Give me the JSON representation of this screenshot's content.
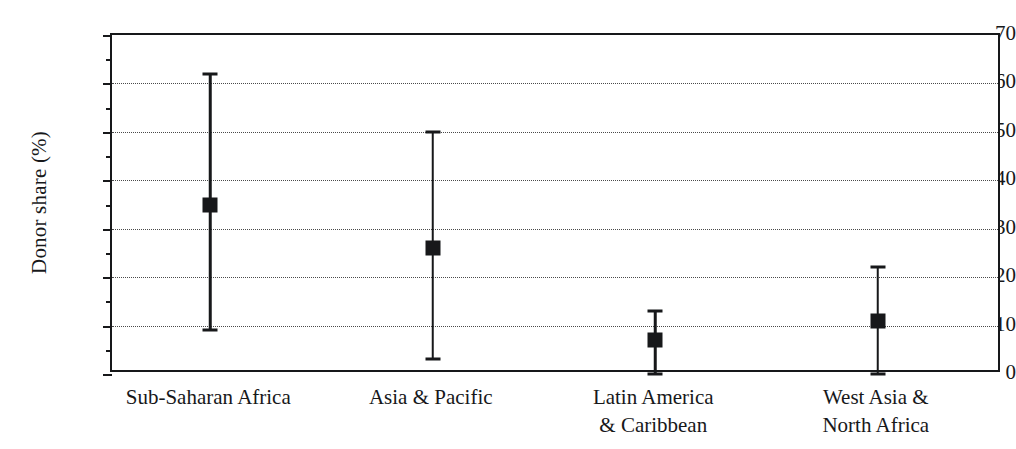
{
  "chart_data": {
    "type": "scatter",
    "title": "",
    "subtitle": "",
    "xlabel": "",
    "ylabel": "Donor share (%)",
    "ylim": [
      0,
      70
    ],
    "ytick_labels": [
      "0",
      "10",
      "20",
      "30",
      "40",
      "50",
      "60",
      "70"
    ],
    "ytick_values": [
      0,
      10,
      20,
      30,
      40,
      50,
      60,
      70
    ],
    "yminor_values": [
      5,
      15,
      25,
      35,
      45,
      55,
      65
    ],
    "grid": "horizontal-dotted-major",
    "legend": "none",
    "categories": [
      "Sub-Saharan Africa",
      "Asia & Pacific",
      "Latin America\n& Caribbean",
      "West Asia &\nNorth Africa"
    ],
    "series": [
      {
        "name": "Donor share (%)",
        "marker": "filled-square",
        "values": [
          35,
          26,
          7,
          11
        ],
        "lower": [
          9,
          3,
          0,
          0
        ],
        "upper": [
          62,
          50,
          13,
          22
        ]
      }
    ],
    "colors": {
      "marker": "#17181a",
      "line": "#17181a",
      "axis": "#17181a",
      "grid": "#4a4a4a",
      "background": "#ffffff"
    }
  },
  "axis": {
    "y_title": "Donor share (%)"
  }
}
